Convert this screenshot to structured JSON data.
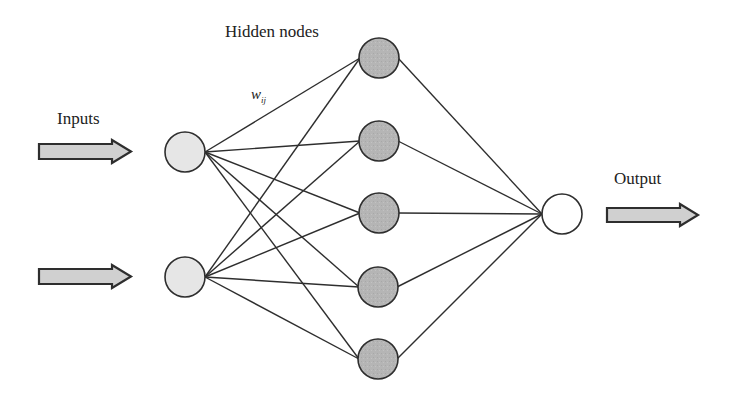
{
  "diagram": {
    "type": "neural-network",
    "labels": {
      "inputs": "Inputs",
      "hidden": "Hidden nodes",
      "output": "Output",
      "weight_main": "w",
      "weight_sub": "ij"
    },
    "colors": {
      "input_fill": "#e6e6e6",
      "hidden_fill": "#b5b5b5",
      "output_fill": "#ffffff",
      "stroke": "#2e2e2e",
      "arrow_fill": "#d0d0d0"
    },
    "layers": {
      "input": [
        {
          "id": "x1",
          "cx": 185,
          "cy": 152
        },
        {
          "id": "x2",
          "cx": 185,
          "cy": 277
        }
      ],
      "hidden": [
        {
          "id": "h1",
          "cx": 379,
          "cy": 58
        },
        {
          "id": "h2",
          "cx": 379,
          "cy": 141
        },
        {
          "id": "h3",
          "cx": 379,
          "cy": 213
        },
        {
          "id": "h4",
          "cx": 378,
          "cy": 287
        },
        {
          "id": "h5",
          "cx": 378,
          "cy": 359
        }
      ],
      "output": [
        {
          "id": "y",
          "cx": 562,
          "cy": 214
        }
      ]
    },
    "node_radius": 20
  }
}
